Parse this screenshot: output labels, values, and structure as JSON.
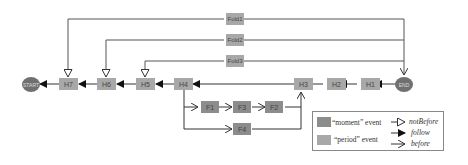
{
  "diagram": {
    "nodes": {
      "start": "START",
      "end": "END",
      "h1": "H1",
      "h2": "H2",
      "h3": "H3",
      "h4": "H4",
      "h5": "H5",
      "h6": "H6",
      "h7": "H7",
      "f1": "F1",
      "f2": "F2",
      "f3": "F3",
      "f4": "F4",
      "fold1": "Fold1",
      "fold2": "Fold2",
      "fold3": "Fold3"
    },
    "legend": {
      "moment_label": "“moment”  event",
      "period_label": "“period”  event",
      "not_before": "notBefore",
      "follow": "follow",
      "before": "before"
    },
    "colors": {
      "moment": "#8c8c8c",
      "period": "#a8a8a8",
      "circle": "#707070",
      "line": "#555555"
    }
  }
}
